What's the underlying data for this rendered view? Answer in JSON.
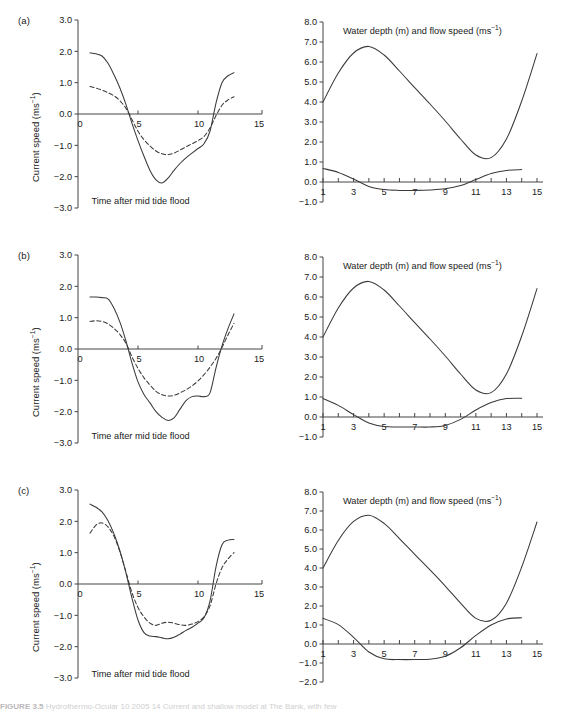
{
  "figure": {
    "caption_bold": "FIGURE 3.5",
    "caption_rest": "    Hydrothermo-Ocular 10 2005 14 Current and shallow model at The Bank, with few",
    "panels": [
      "(a)",
      "(b)",
      "(c)"
    ]
  },
  "left_axes": {
    "ylabel_main": "Current speed (ms",
    "ylabel_sup": "−1",
    "ylabel_close": ")",
    "xlabel": "Time after mid tide flood",
    "yticks": [
      "3.0",
      "2.0",
      "1.0",
      "0.0",
      "−1.0",
      "−2.0",
      "−3.0"
    ],
    "ytick_values": [
      3.0,
      2.0,
      1.0,
      0.0,
      -1.0,
      -2.0,
      -3.0
    ],
    "xticks": [
      "0",
      "5",
      "10",
      "15"
    ],
    "xtick_values": [
      0,
      5,
      10,
      15
    ],
    "ylim": [
      -3.0,
      3.0
    ],
    "xlim": [
      0,
      15
    ]
  },
  "right_axes": {
    "title_main": "Water depth (m) and flow speed (ms",
    "title_sup": "−1",
    "title_close": ")",
    "yticks_ab": [
      "8.0",
      "7.0",
      "6.0",
      "5.0",
      "4.0",
      "3.0",
      "2.0",
      "1.0",
      "0.0",
      "−1.0"
    ],
    "ytick_values_ab": [
      8.0,
      7.0,
      6.0,
      5.0,
      4.0,
      3.0,
      2.0,
      1.0,
      0.0,
      -1.0
    ],
    "yticks_c": [
      "8.0",
      "7.0",
      "6.0",
      "5.0",
      "4.0",
      "3.0",
      "2.0",
      "1.0",
      "0.0",
      "−1.0",
      "−2.0"
    ],
    "ytick_values_c": [
      8.0,
      7.0,
      6.0,
      5.0,
      4.0,
      3.0,
      2.0,
      1.0,
      0.0,
      -1.0,
      -2.0
    ],
    "xticks": [
      "1",
      "3",
      "5",
      "7",
      "9",
      "11",
      "13",
      "15"
    ],
    "xtick_values": [
      1,
      3,
      5,
      7,
      9,
      11,
      13,
      15
    ],
    "ylim_ab": [
      -1.0,
      8.0
    ],
    "ylim_c": [
      -2.0,
      8.0
    ],
    "xlim": [
      1,
      15
    ]
  },
  "chart_data": [
    {
      "type": "line",
      "panel": "(a)",
      "position": "left",
      "title": "",
      "xlabel": "Time after mid tide flood",
      "ylabel": "Current speed (ms−1)",
      "xlim": [
        0,
        15
      ],
      "ylim": [
        -3.0,
        3.0
      ],
      "grid": false,
      "legend": "none",
      "x": [
        1.0,
        1.5,
        2.0,
        2.5,
        3.0,
        3.5,
        4.0,
        4.5,
        5.0,
        5.5,
        6.0,
        6.5,
        7.0,
        7.5,
        8.0,
        8.5,
        9.0,
        9.5,
        10.0,
        10.5,
        11.0,
        11.5,
        12.0,
        12.5,
        13.0
      ],
      "series": [
        {
          "name": "solid-current",
          "style": "solid",
          "values": [
            1.95,
            1.92,
            1.85,
            1.62,
            1.25,
            0.82,
            0.3,
            -0.3,
            -0.85,
            -1.35,
            -1.8,
            -2.1,
            -2.2,
            -2.05,
            -1.8,
            -1.58,
            -1.4,
            -1.25,
            -1.1,
            -0.95,
            -0.55,
            0.35,
            1.0,
            1.22,
            1.32
          ]
        },
        {
          "name": "dashed-current",
          "style": "dashed",
          "values": [
            0.88,
            0.83,
            0.76,
            0.68,
            0.58,
            0.42,
            0.18,
            -0.18,
            -0.55,
            -0.82,
            -1.02,
            -1.18,
            -1.27,
            -1.3,
            -1.25,
            -1.15,
            -1.05,
            -0.95,
            -0.85,
            -0.72,
            -0.45,
            -0.05,
            0.28,
            0.45,
            0.55
          ]
        }
      ]
    },
    {
      "type": "line",
      "panel": "(a)",
      "position": "right",
      "title": "Water depth (m) and flow speed (ms−1)",
      "xlabel": "",
      "ylabel": "",
      "xlim": [
        1,
        15
      ],
      "ylim": [
        -1.0,
        8.0
      ],
      "grid": false,
      "legend": "none",
      "x": [
        1,
        2,
        3,
        4,
        5,
        6,
        7,
        8,
        9,
        10,
        11,
        12,
        13,
        14,
        15
      ],
      "series": [
        {
          "name": "water-depth",
          "style": "solid",
          "values": [
            4.0,
            5.45,
            6.45,
            6.78,
            6.35,
            5.55,
            4.72,
            3.9,
            3.05,
            2.15,
            1.35,
            1.22,
            2.15,
            4.05,
            6.42
          ]
        },
        {
          "name": "flow-speed",
          "style": "solid",
          "values": [
            0.68,
            0.48,
            0.15,
            -0.22,
            -0.38,
            -0.42,
            -0.42,
            -0.4,
            -0.34,
            -0.18,
            0.12,
            0.42,
            0.58,
            0.62,
            null
          ]
        }
      ]
    },
    {
      "type": "line",
      "panel": "(b)",
      "position": "left",
      "title": "",
      "xlabel": "Time after mid tide flood",
      "ylabel": "Current speed (ms−1)",
      "xlim": [
        0,
        15
      ],
      "ylim": [
        -3.0,
        3.0
      ],
      "grid": false,
      "legend": "none",
      "x": [
        1.0,
        1.5,
        2.0,
        2.5,
        3.0,
        3.5,
        4.0,
        4.5,
        5.0,
        5.5,
        6.0,
        6.5,
        7.0,
        7.5,
        8.0,
        8.5,
        9.0,
        9.5,
        10.0,
        10.5,
        11.0,
        11.5,
        12.0,
        12.5,
        13.0
      ],
      "series": [
        {
          "name": "solid-current",
          "style": "solid",
          "values": [
            1.66,
            1.66,
            1.64,
            1.6,
            1.3,
            0.85,
            0.25,
            -0.45,
            -1.05,
            -1.45,
            -1.72,
            -2.0,
            -2.18,
            -2.28,
            -2.2,
            -1.92,
            -1.65,
            -1.52,
            -1.5,
            -1.52,
            -1.4,
            -0.6,
            0.1,
            0.65,
            1.12
          ]
        },
        {
          "name": "dashed-current",
          "style": "dashed",
          "values": [
            0.88,
            0.9,
            0.88,
            0.8,
            0.66,
            0.46,
            0.18,
            -0.25,
            -0.62,
            -0.92,
            -1.15,
            -1.35,
            -1.46,
            -1.5,
            -1.48,
            -1.4,
            -1.3,
            -1.18,
            -1.02,
            -0.82,
            -0.58,
            -0.3,
            0.05,
            0.45,
            0.82
          ]
        }
      ]
    },
    {
      "type": "line",
      "panel": "(b)",
      "position": "right",
      "title": "Water depth (m) and flow speed (ms−1)",
      "xlabel": "",
      "ylabel": "",
      "xlim": [
        1,
        15
      ],
      "ylim": [
        -1.0,
        8.0
      ],
      "grid": false,
      "legend": "none",
      "x": [
        1,
        2,
        3,
        4,
        5,
        6,
        7,
        8,
        9,
        10,
        11,
        12,
        13,
        14,
        15
      ],
      "series": [
        {
          "name": "water-depth",
          "style": "solid",
          "values": [
            4.0,
            5.45,
            6.45,
            6.78,
            6.35,
            5.55,
            4.72,
            3.9,
            3.05,
            2.15,
            1.35,
            1.22,
            2.15,
            4.05,
            6.42
          ]
        },
        {
          "name": "flow-speed",
          "style": "solid",
          "values": [
            0.92,
            0.58,
            0.12,
            -0.3,
            -0.48,
            -0.5,
            -0.5,
            -0.5,
            -0.42,
            -0.12,
            0.35,
            0.72,
            0.92,
            0.94,
            null
          ]
        }
      ]
    },
    {
      "type": "line",
      "panel": "(c)",
      "position": "left",
      "title": "",
      "xlabel": "Time after mid tide flood",
      "ylabel": "Current speed (ms−1)",
      "xlim": [
        0,
        15
      ],
      "ylim": [
        -3.0,
        3.0
      ],
      "grid": false,
      "legend": "none",
      "x": [
        1.0,
        1.5,
        2.0,
        2.5,
        3.0,
        3.5,
        4.0,
        4.5,
        5.0,
        5.5,
        6.0,
        6.5,
        7.0,
        7.5,
        8.0,
        8.5,
        9.0,
        9.5,
        10.0,
        10.5,
        11.0,
        11.5,
        12.0,
        12.5,
        13.0
      ],
      "series": [
        {
          "name": "solid-current",
          "style": "solid",
          "values": [
            2.55,
            2.45,
            2.3,
            2.02,
            1.6,
            1.05,
            0.35,
            -0.45,
            -1.15,
            -1.55,
            -1.66,
            -1.68,
            -1.72,
            -1.75,
            -1.7,
            -1.6,
            -1.48,
            -1.38,
            -1.25,
            -1.08,
            -0.55,
            0.55,
            1.25,
            1.4,
            1.42
          ]
        },
        {
          "name": "dashed-current",
          "style": "dashed",
          "values": [
            1.62,
            1.88,
            1.95,
            1.82,
            1.52,
            1.02,
            0.38,
            -0.28,
            -0.75,
            -1.05,
            -1.25,
            -1.32,
            -1.25,
            -1.22,
            -1.25,
            -1.3,
            -1.32,
            -1.28,
            -1.2,
            -1.05,
            -0.7,
            0.0,
            0.52,
            0.8,
            1.0
          ]
        }
      ]
    },
    {
      "type": "line",
      "panel": "(c)",
      "position": "right",
      "title": "Water depth (m) and flow speed (ms−1)",
      "xlabel": "",
      "ylabel": "",
      "xlim": [
        1,
        15
      ],
      "ylim": [
        -2.0,
        8.0
      ],
      "grid": false,
      "legend": "none",
      "x": [
        1,
        2,
        3,
        4,
        5,
        6,
        7,
        8,
        9,
        10,
        11,
        12,
        13,
        14,
        15
      ],
      "series": [
        {
          "name": "water-depth",
          "style": "solid",
          "values": [
            4.0,
            5.45,
            6.45,
            6.78,
            6.35,
            5.55,
            4.72,
            3.9,
            3.05,
            2.15,
            1.35,
            1.25,
            2.15,
            4.05,
            6.42
          ]
        },
        {
          "name": "flow-speed",
          "style": "solid",
          "values": [
            1.35,
            1.02,
            0.35,
            -0.42,
            -0.78,
            -0.82,
            -0.82,
            -0.8,
            -0.65,
            -0.2,
            0.45,
            1.0,
            1.32,
            1.38,
            null
          ]
        }
      ]
    }
  ]
}
